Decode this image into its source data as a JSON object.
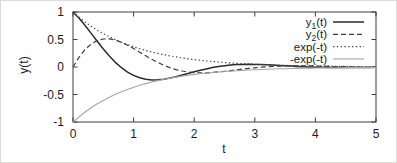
{
  "figure": {
    "background": "#ffffff",
    "frame_color": "#3e3e3e",
    "text_color": "#1c1c1c"
  },
  "chart_data": {
    "type": "line",
    "title": "",
    "xlabel": "t",
    "ylabel": "y(t)",
    "xlim": [
      0,
      5
    ],
    "ylim": [
      -1,
      1
    ],
    "xticks": [
      0,
      1,
      2,
      3,
      4,
      5
    ],
    "yticks": [
      1,
      0.5,
      0,
      -0.5,
      -1
    ],
    "grid": false,
    "legend_position": "top-right",
    "x": {
      "start": 0,
      "step": 0.1,
      "count": 51
    },
    "series": [
      {
        "name": "y1(t)",
        "legend": {
          "base": "y",
          "sub": "1",
          "rest": "(t)"
        },
        "style": "solid",
        "color": "#2b2b2b",
        "width": 1.5,
        "values": [
          1,
          0.887,
          0.754,
          0.611,
          0.467,
          0.328,
          0.199,
          0.084,
          -0.013,
          -0.092,
          -0.153,
          -0.196,
          -0.222,
          -0.234,
          -0.232,
          -0.221,
          -0.202,
          -0.177,
          -0.148,
          -0.118,
          -0.088,
          -0.06,
          -0.034,
          -0.011,
          0.008,
          0.023,
          0.035,
          0.043,
          0.047,
          0.049,
          0.048,
          0.045,
          0.041,
          0.035,
          0.029,
          0.023,
          0.017,
          0.011,
          0.006,
          0.001,
          -0.003,
          -0.006,
          -0.008,
          -0.009,
          -0.01,
          -0.01,
          -0.01,
          -0.009,
          -0.008,
          -0.007,
          -0.006
        ]
      },
      {
        "name": "y2(t)",
        "legend": {
          "base": "y",
          "sub": "2",
          "rest": "(t)"
        },
        "style": "dashed",
        "color": "#3d3d3d",
        "width": 1.2,
        "values": [
          0,
          0.18,
          0.319,
          0.418,
          0.481,
          0.51,
          0.512,
          0.489,
          0.449,
          0.396,
          0.335,
          0.269,
          0.204,
          0.14,
          0.083,
          0.031,
          -0.012,
          -0.047,
          -0.073,
          -0.092,
          -0.102,
          -0.107,
          -0.105,
          -0.1,
          -0.09,
          -0.079,
          -0.066,
          -0.052,
          -0.038,
          -0.026,
          -0.014,
          -0.004,
          0.005,
          0.011,
          0.017,
          0.02,
          0.022,
          0.022,
          0.022,
          0.02,
          0.018,
          0.016,
          0.013,
          0.01,
          0.007,
          0.005,
          0.002,
          0,
          -0.001,
          -0.003,
          -0.004
        ]
      },
      {
        "name": "exp(-t)",
        "legend": {
          "base": "exp(-t)",
          "sub": "",
          "rest": ""
        },
        "style": "dotted",
        "color": "#4a4a4a",
        "width": 1.2,
        "values": [
          1,
          0.905,
          0.819,
          0.741,
          0.67,
          0.607,
          0.549,
          0.497,
          0.449,
          0.407,
          0.368,
          0.333,
          0.301,
          0.273,
          0.247,
          0.223,
          0.202,
          0.183,
          0.165,
          0.15,
          0.135,
          0.122,
          0.111,
          0.1,
          0.091,
          0.082,
          0.074,
          0.067,
          0.061,
          0.055,
          0.05,
          0.045,
          0.041,
          0.037,
          0.033,
          0.03,
          0.027,
          0.025,
          0.022,
          0.02,
          0.018,
          0.017,
          0.015,
          0.014,
          0.012,
          0.011,
          0.01,
          0.009,
          0.008,
          0.007,
          0.007
        ]
      },
      {
        "name": "-exp(-t)",
        "legend": {
          "base": "-exp(-t)",
          "sub": "",
          "rest": ""
        },
        "style": "solid",
        "color": "#a6a6a6",
        "width": 1.1,
        "values": [
          -1,
          -0.905,
          -0.819,
          -0.741,
          -0.67,
          -0.607,
          -0.549,
          -0.497,
          -0.449,
          -0.407,
          -0.368,
          -0.333,
          -0.301,
          -0.273,
          -0.247,
          -0.223,
          -0.202,
          -0.183,
          -0.165,
          -0.15,
          -0.135,
          -0.122,
          -0.111,
          -0.1,
          -0.091,
          -0.082,
          -0.074,
          -0.067,
          -0.061,
          -0.055,
          -0.05,
          -0.045,
          -0.041,
          -0.037,
          -0.033,
          -0.03,
          -0.027,
          -0.025,
          -0.022,
          -0.02,
          -0.018,
          -0.017,
          -0.015,
          -0.014,
          -0.012,
          -0.011,
          -0.01,
          -0.009,
          -0.008,
          -0.007,
          -0.007
        ]
      }
    ]
  }
}
